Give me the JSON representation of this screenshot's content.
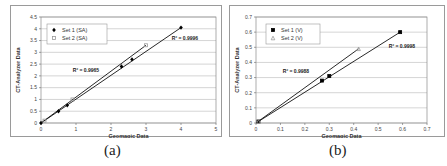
{
  "chart_data": [
    {
      "id": "a",
      "type": "scatter",
      "caption": "(a)",
      "title": "",
      "xlabel": "Geomagic Data",
      "ylabel": "CT-Analyzer Data",
      "xlim": [
        0,
        5
      ],
      "ylim": [
        0,
        4.5
      ],
      "xticks": [
        "0",
        "1",
        "2",
        "3",
        "4",
        "5"
      ],
      "yticks": [
        "0",
        "0.5",
        "1",
        "1.5",
        "2",
        "2.5",
        "3",
        "3.5",
        "4",
        "4.5"
      ],
      "grid": "horizontal",
      "legend_position": "upper-left",
      "series": [
        {
          "name": "Set 1 (SA)",
          "marker": "diamond",
          "color": "#000000",
          "x": [
            0.0,
            0.5,
            0.75,
            2.3,
            2.6,
            4.0
          ],
          "y": [
            0.0,
            0.5,
            0.75,
            2.4,
            2.7,
            4.05
          ],
          "trendline": {
            "x": [
              0.0,
              4.0
            ],
            "y": [
              0.0,
              4.05
            ]
          },
          "r2_label": "R² = 0.9996"
        },
        {
          "name": "Set 2 (SA)",
          "marker": "square",
          "color": "#999999",
          "x": [
            0.1,
            0.9,
            3.0
          ],
          "y": [
            0.1,
            1.0,
            3.3
          ],
          "trendline": {
            "x": [
              0.0,
              3.0
            ],
            "y": [
              0.0,
              3.3
            ]
          },
          "r2_label": "R² = 0.9965"
        }
      ]
    },
    {
      "id": "b",
      "type": "scatter",
      "caption": "(b)",
      "title": "",
      "xlabel": "Geomagic Data",
      "ylabel": "CT-Analyzer Data",
      "xlim": [
        0,
        0.7
      ],
      "ylim": [
        0,
        0.7
      ],
      "xticks": [
        "0",
        "0.1",
        "0.2",
        "0.3",
        "0.4",
        "0.5",
        "0.6",
        "0.7"
      ],
      "yticks": [
        "0",
        "0.1",
        "0.2",
        "0.3",
        "0.4",
        "0.5",
        "0.6",
        "0.7"
      ],
      "grid": "horizontal",
      "legend_position": "upper-left",
      "series": [
        {
          "name": "Set 1 (V)",
          "marker": "square",
          "color": "#000000",
          "x": [
            0.01,
            0.27,
            0.3,
            0.59
          ],
          "y": [
            0.01,
            0.28,
            0.31,
            0.6
          ],
          "trendline": {
            "x": [
              0.0,
              0.59
            ],
            "y": [
              0.0,
              0.6
            ]
          },
          "r2_label": "R² = 0.9998"
        },
        {
          "name": "Set 2 (V)",
          "marker": "triangle",
          "color": "#999999",
          "x": [
            0.01,
            0.42
          ],
          "y": [
            0.01,
            0.49
          ],
          "trendline": {
            "x": [
              0.0,
              0.42
            ],
            "y": [
              0.0,
              0.49
            ]
          },
          "r2_label": "R² = 0.9988"
        }
      ]
    }
  ],
  "layout": [
    {
      "plot": {
        "left": 30,
        "top": 11,
        "width": 175,
        "height": 106
      },
      "legend": {
        "left": 36,
        "top": 18,
        "width": 60,
        "height": 20
      },
      "r2_pos": [
        {
          "x": 174,
          "y": 34
        },
        {
          "x": 75,
          "y": 66
        }
      ]
    },
    {
      "plot": {
        "left": 26,
        "top": 11,
        "width": 171,
        "height": 106
      },
      "legend": {
        "left": 36,
        "top": 18,
        "width": 54,
        "height": 20
      },
      "r2_pos": [
        {
          "x": 172,
          "y": 42
        },
        {
          "x": 66,
          "y": 67
        }
      ]
    }
  ]
}
